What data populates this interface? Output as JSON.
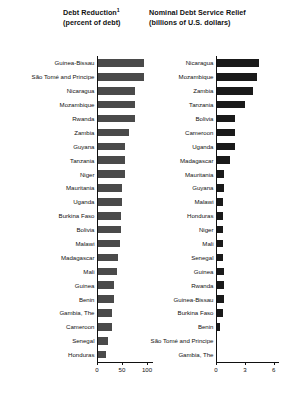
{
  "chart_data": [
    {
      "type": "bar",
      "orientation": "horizontal",
      "panel": "left",
      "title": "Debt Reduction",
      "title_footnote_marker": "1",
      "subtitle": "(percent of debt)",
      "xlabel": "",
      "ylabel": "",
      "xlim": [
        0,
        110
      ],
      "xticks": [
        0,
        50,
        100
      ],
      "xtick_labels": [
        "0",
        "50",
        "100"
      ],
      "xticks_minor": [
        25,
        75
      ],
      "grid": false,
      "legend": "none",
      "bar_color": "#4a4a4a",
      "categories": [
        "Guinea-Bissau",
        "São Tomé and Principe",
        "Nicaragua",
        "Mozambique",
        "Rwanda",
        "Zambia",
        "Guyana",
        "Tanzania",
        "Niger",
        "Mauritania",
        "Uganda",
        "Burkina Faso",
        "Bolivia",
        "Malawi",
        "Madagascar",
        "Mali",
        "Guinea",
        "Benin",
        "Gambia, The",
        "Cameroon",
        "Senegal",
        "Honduras"
      ],
      "values": [
        93,
        93,
        75,
        76,
        75,
        64,
        56,
        56,
        56,
        50,
        49,
        48,
        47,
        46,
        41,
        39,
        34,
        34,
        30,
        30,
        21,
        18
      ]
    },
    {
      "type": "bar",
      "orientation": "horizontal",
      "panel": "right",
      "title": "Nominal Debt Service Relief",
      "subtitle": "(billions of U.S. dollars)",
      "xlabel": "",
      "ylabel": "",
      "xlim": [
        0,
        6.4
      ],
      "xticks": [
        0,
        3,
        6
      ],
      "xtick_labels": [
        "0",
        "3",
        "6"
      ],
      "xticks_minor": [
        1,
        2,
        4,
        5
      ],
      "grid": false,
      "legend": "none",
      "bar_color": "#1a1a1a",
      "categories": [
        "Nicaragua",
        "Mozambique",
        "Zambia",
        "Tanzania",
        "Bolivia",
        "Cameroon",
        "Uganda",
        "Madagascar",
        "Mauritania",
        "Guyana",
        "Malawi",
        "Honduras",
        "Niger",
        "Mali",
        "Senegal",
        "Guinea",
        "Rwanda",
        "Guinea-Bissau",
        "Burkina Faso",
        "Benin",
        "São Tomé and Principe",
        "Gambia, The"
      ],
      "values": [
        4.5,
        4.3,
        3.8,
        3.0,
        2.0,
        2.0,
        1.95,
        1.5,
        0.85,
        0.8,
        0.75,
        0.75,
        0.75,
        0.75,
        0.75,
        0.8,
        0.8,
        0.8,
        0.7,
        0.4,
        0.1,
        0.04
      ]
    }
  ]
}
